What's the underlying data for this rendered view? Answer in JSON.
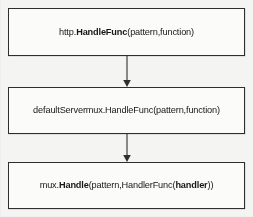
{
  "diagram": {
    "type": "flowchart",
    "orientation": "vertical-top-down",
    "background_color": "#f4f4f2",
    "box_border_color": "#2e2e2e",
    "box_fill_color": "#fbfbfa",
    "text_color": "#17171a",
    "nodes": [
      {
        "id": "http-handlefunc",
        "segments": [
          {
            "text": "http.",
            "bold": false
          },
          {
            "text": "HandleFunc",
            "bold": true
          },
          {
            "text": "(pattern,function)",
            "bold": false
          }
        ],
        "plain_text": "http.HandleFunc(pattern,function)"
      },
      {
        "id": "defaultservermux-handlefunc",
        "segments": [
          {
            "text": "defaultServermux.HandleFunc(pattern,function)",
            "bold": false
          }
        ],
        "plain_text": "defaultServermux.HandleFunc(pattern,function)"
      },
      {
        "id": "mux-handle",
        "segments": [
          {
            "text": "mux.",
            "bold": false
          },
          {
            "text": "Handle",
            "bold": true
          },
          {
            "text": "(pattern,HandlerFunc(",
            "bold": false
          },
          {
            "text": "handler",
            "bold": true
          },
          {
            "text": "))",
            "bold": false
          }
        ],
        "plain_text": "mux.Handle(pattern,HandlerFunc(handler))"
      }
    ],
    "edges": [
      {
        "id": "edge-1",
        "from": "http-handlefunc",
        "to": "defaultservermux-handlefunc",
        "arrow": "down"
      },
      {
        "id": "edge-2",
        "from": "defaultservermux-handlefunc",
        "to": "mux-handle",
        "arrow": "down"
      }
    ]
  }
}
